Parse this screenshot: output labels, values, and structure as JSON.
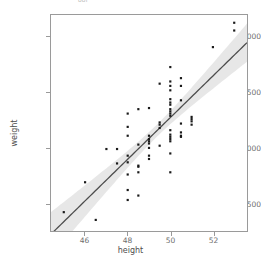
{
  "figure": {
    "top_strip_fragments": [
      {
        "text": "ool",
        "x": 78
      },
      {
        "text": "",
        "x": 150
      },
      {
        "text": "",
        "x": 215
      }
    ]
  },
  "chart_data": {
    "type": "scatter",
    "title": "",
    "xlabel": "height",
    "ylabel": "weight",
    "xlim": [
      44.4,
      53.6
    ],
    "ylim": [
      2250,
      4200
    ],
    "xticks": [
      46,
      48,
      50,
      52
    ],
    "yticks": [
      2500,
      3000,
      3500,
      4000
    ],
    "grid": false,
    "legend": "none",
    "point_color": "#1a1a1a",
    "line_color": "#4d4d4d",
    "ribbon_color": "#bfbfbf",
    "panel_border_color": "#9a9a9a",
    "panel_background": "#ffffff",
    "series": [
      {
        "name": "observations",
        "x": [
          45.0,
          46.0,
          46.5,
          47.0,
          47.5,
          47.5,
          48.0,
          48.0,
          48.0,
          48.0,
          48.0,
          48.0,
          48.0,
          48.0,
          48.5,
          48.5,
          48.5,
          48.5,
          48.5,
          48.5,
          49.0,
          49.0,
          49.0,
          49.0,
          49.0,
          49.0,
          49.0,
          49.0,
          49.5,
          49.5,
          49.5,
          49.5,
          49.5,
          50.0,
          50.0,
          50.0,
          50.0,
          50.0,
          50.0,
          50.0,
          50.0,
          50.0,
          50.0,
          50.0,
          50.0,
          50.0,
          50.0,
          50.0,
          50.0,
          50.0,
          50.0,
          50.5,
          50.5,
          50.5,
          50.5,
          50.5,
          50.5,
          50.5,
          51.0,
          51.0,
          51.0,
          51.0,
          52.0,
          53.0,
          53.0
        ],
        "y": [
          2420,
          2690,
          2350,
          2990,
          2990,
          2860,
          3310,
          3190,
          3110,
          2930,
          2760,
          2620,
          2530,
          2870,
          2840,
          2830,
          2780,
          2570,
          3030,
          3350,
          3360,
          3110,
          3080,
          3060,
          3040,
          3000,
          2930,
          2900,
          3580,
          3230,
          3210,
          3180,
          3020,
          3730,
          3600,
          3560,
          3520,
          3440,
          3410,
          3390,
          3350,
          3330,
          3310,
          3290,
          3160,
          3120,
          3100,
          3080,
          3060,
          2950,
          2780,
          3630,
          3560,
          3430,
          3220,
          3140,
          3110,
          3100,
          3280,
          3260,
          3240,
          3210,
          3910,
          4130,
          4060
        ]
      }
    ],
    "fit": {
      "type": "linear-regression",
      "line": [
        [
          44.4,
          2330
        ],
        [
          53.6,
          3900
        ]
      ],
      "confidence_band": "se"
    }
  }
}
